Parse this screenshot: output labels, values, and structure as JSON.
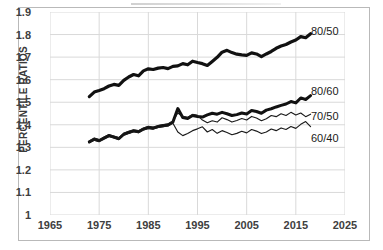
{
  "chart_data": {
    "type": "line",
    "title": "",
    "xlabel": "",
    "ylabel": "PERCENTILE RATIOS",
    "xlim": [
      1965,
      2025
    ],
    "ylim": [
      1.0,
      1.9
    ],
    "grid": true,
    "legend_position": "inline-right",
    "y_ticks": [
      "1",
      "1.1",
      "1.2",
      "1.3",
      "1.4",
      "1.5",
      "1.6",
      "1.7",
      "1.8",
      "1.9"
    ],
    "x_ticks": [
      "1965",
      "1975",
      "1985",
      "1995",
      "2005",
      "2015",
      "2025"
    ],
    "series": [
      {
        "name": "80/50",
        "color": "#111111",
        "width": 3.2,
        "x": [
          1973,
          1974,
          1975,
          1976,
          1977,
          1978,
          1979,
          1980,
          1981,
          1982,
          1983,
          1984,
          1985,
          1986,
          1987,
          1988,
          1989,
          1990,
          1991,
          1992,
          1993,
          1994,
          1995,
          1996,
          1997,
          1998,
          1999,
          2000,
          2001,
          2002,
          2003,
          2004,
          2005,
          2006,
          2007,
          2008,
          2009,
          2010,
          2011,
          2012,
          2013,
          2014,
          2015,
          2016,
          2017,
          2018
        ],
        "values": [
          1.525,
          1.545,
          1.552,
          1.56,
          1.572,
          1.579,
          1.575,
          1.597,
          1.612,
          1.623,
          1.617,
          1.639,
          1.648,
          1.645,
          1.651,
          1.654,
          1.649,
          1.659,
          1.661,
          1.671,
          1.666,
          1.682,
          1.676,
          1.671,
          1.663,
          1.681,
          1.699,
          1.722,
          1.73,
          1.72,
          1.713,
          1.71,
          1.708,
          1.719,
          1.714,
          1.702,
          1.714,
          1.725,
          1.739,
          1.749,
          1.756,
          1.767,
          1.776,
          1.791,
          1.786,
          1.804
        ]
      },
      {
        "name": "80/60",
        "color": "#111111",
        "width": 3.0,
        "x": [
          1973,
          1974,
          1975,
          1976,
          1977,
          1978,
          1979,
          1980,
          1981,
          1982,
          1983,
          1984,
          1985,
          1986,
          1987,
          1988,
          1989,
          1990,
          1991,
          1992,
          1993,
          1994,
          1995,
          1996,
          1997,
          1998,
          1999,
          2000,
          2001,
          2002,
          2003,
          2004,
          2005,
          2006,
          2007,
          2008,
          2009,
          2010,
          2011,
          2012,
          2013,
          2014,
          2015,
          2016,
          2017,
          2018
        ],
        "values": [
          1.324,
          1.336,
          1.329,
          1.341,
          1.352,
          1.345,
          1.338,
          1.358,
          1.366,
          1.373,
          1.369,
          1.381,
          1.388,
          1.385,
          1.392,
          1.396,
          1.399,
          1.412,
          1.472,
          1.432,
          1.428,
          1.441,
          1.437,
          1.434,
          1.444,
          1.451,
          1.447,
          1.455,
          1.449,
          1.441,
          1.445,
          1.452,
          1.448,
          1.463,
          1.459,
          1.451,
          1.465,
          1.471,
          1.479,
          1.486,
          1.492,
          1.503,
          1.497,
          1.519,
          1.512,
          1.529
        ]
      },
      {
        "name": "70/50",
        "color": "#1a1a1a",
        "width": 1.15,
        "x": [
          1973,
          1974,
          1975,
          1976,
          1977,
          1978,
          1979,
          1980,
          1981,
          1982,
          1983,
          1984,
          1985,
          1986,
          1987,
          1988,
          1989,
          1990,
          1991,
          1992,
          1993,
          1994,
          1995,
          1996,
          1997,
          1998,
          1999,
          2000,
          2001,
          2002,
          2003,
          2004,
          2005,
          2006,
          2007,
          2008,
          2009,
          2010,
          2011,
          2012,
          2013,
          2014,
          2015,
          2016,
          2017,
          2018
        ],
        "values": [
          1.328,
          1.341,
          1.334,
          1.346,
          1.357,
          1.35,
          1.343,
          1.362,
          1.371,
          1.378,
          1.374,
          1.386,
          1.393,
          1.39,
          1.397,
          1.401,
          1.404,
          1.417,
          1.452,
          1.437,
          1.433,
          1.446,
          1.442,
          1.421,
          1.409,
          1.418,
          1.412,
          1.431,
          1.423,
          1.412,
          1.419,
          1.428,
          1.421,
          1.437,
          1.43,
          1.418,
          1.427,
          1.441,
          1.436,
          1.449,
          1.441,
          1.455,
          1.443,
          1.452,
          1.436,
          1.447
        ]
      },
      {
        "name": "60/40",
        "color": "#1a1a1a",
        "width": 1.15,
        "x": [
          1973,
          1974,
          1975,
          1976,
          1977,
          1978,
          1979,
          1980,
          1981,
          1982,
          1983,
          1984,
          1985,
          1986,
          1987,
          1988,
          1989,
          1990,
          1991,
          1992,
          1993,
          1994,
          1995,
          1996,
          1997,
          1998,
          1999,
          2000,
          2001,
          2002,
          2003,
          2004,
          2005,
          2006,
          2007,
          2008,
          2009,
          2010,
          2011,
          2012,
          2013,
          2014,
          2015,
          2016,
          2017,
          2018
        ],
        "values": [
          1.321,
          1.332,
          1.326,
          1.338,
          1.348,
          1.342,
          1.335,
          1.354,
          1.362,
          1.369,
          1.365,
          1.377,
          1.384,
          1.381,
          1.388,
          1.392,
          1.395,
          1.407,
          1.368,
          1.352,
          1.361,
          1.374,
          1.382,
          1.391,
          1.368,
          1.379,
          1.362,
          1.374,
          1.366,
          1.356,
          1.362,
          1.371,
          1.364,
          1.379,
          1.372,
          1.361,
          1.368,
          1.381,
          1.374,
          1.386,
          1.379,
          1.392,
          1.384,
          1.402,
          1.414,
          1.392
        ]
      }
    ]
  },
  "axis": {
    "y_title": "PERCENTILE RATIOS"
  },
  "labels": {
    "s1": "80/50",
    "s2": "80/60",
    "s3": "70/50",
    "s4": "60/40"
  },
  "colors": {
    "line": "#111111",
    "grid": "#d9d9d9",
    "frame": "#b9b9b9",
    "text": "#404040"
  }
}
